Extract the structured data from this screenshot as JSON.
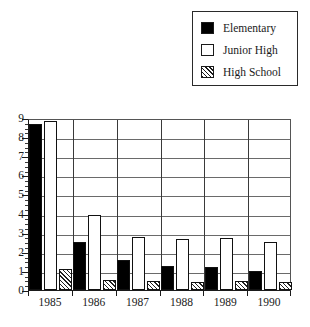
{
  "legend": {
    "position": "top-right",
    "entries": [
      {
        "label": "Elementary",
        "swatch": "solid-black-square-icon",
        "style": "solid"
      },
      {
        "label": "Junior High",
        "swatch": "open-white-square-icon",
        "style": "open"
      },
      {
        "label": "High School",
        "swatch": "hatched-square-icon",
        "style": "hatched"
      }
    ]
  },
  "chart_data": {
    "type": "bar",
    "title": "",
    "xlabel": "",
    "ylabel": "",
    "categories": [
      "1985",
      "1986",
      "1987",
      "1988",
      "1989",
      "1990"
    ],
    "series": [
      {
        "name": "Elementary",
        "values": [
          8.7,
          2.5,
          1.55,
          1.25,
          1.2,
          1.0
        ]
      },
      {
        "name": "Junior High",
        "values": [
          8.85,
          3.9,
          2.8,
          2.65,
          2.7,
          2.5
        ]
      },
      {
        "name": "High School",
        "values": [
          1.1,
          0.5,
          0.45,
          0.4,
          0.45,
          0.4
        ]
      }
    ],
    "ylim": [
      0,
      9
    ],
    "yticks": [
      0,
      1,
      2,
      3,
      4,
      5,
      6,
      7,
      8,
      9
    ],
    "ytick_labels": [
      "0",
      "1",
      "2",
      "3",
      "4",
      "5",
      "6",
      "7",
      "8",
      "9"
    ],
    "minor_ticks": true,
    "minor_tick_step": 0.25,
    "grid": "horizontal-and-vertical",
    "legend_position": "top-right",
    "colors": {
      "Elementary": "#000000",
      "Junior High": "#ffffff",
      "High School": "#ffffff",
      "outline": "#111111",
      "grid": "#6a6a6a",
      "background": "#ffffff"
    }
  }
}
